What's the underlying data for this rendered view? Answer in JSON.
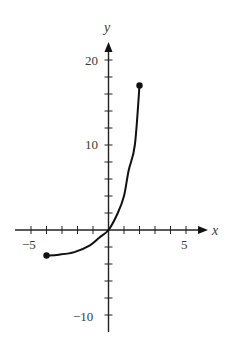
{
  "chart_data": {
    "type": "line",
    "title": "",
    "xlabel": "x",
    "ylabel": "y",
    "xlim": [
      -6.1,
      6.5
    ],
    "ylim": [
      -11.7,
      21.9
    ],
    "x_ticks": [
      -5,
      -4,
      -3,
      -2,
      -1,
      1,
      2,
      3,
      4,
      5
    ],
    "x_tick_labels": [
      {
        "value": -5,
        "label": "−5"
      },
      {
        "value": 5,
        "label": "5"
      }
    ],
    "y_ticks": [
      -10,
      -8,
      -6,
      -4,
      -2,
      2,
      4,
      6,
      8,
      10,
      12,
      14,
      16,
      18,
      20
    ],
    "y_tick_labels": [
      {
        "value": 20,
        "label": "20"
      },
      {
        "value": 10,
        "label": "10"
      },
      {
        "value": -10,
        "label": "−10"
      }
    ],
    "grid": false,
    "legend": null,
    "series": [
      {
        "name": "curve",
        "x": [
          -4,
          -3.2,
          -2.2,
          -1.2,
          -0.6,
          0,
          0.6,
          1.0,
          1.3,
          1.7,
          2.0
        ],
        "y": [
          -3.0,
          -2.9,
          -2.6,
          -1.8,
          -0.9,
          0,
          2,
          4,
          7,
          10,
          17
        ],
        "endpoints": [
          {
            "x": -4,
            "y": -3.0,
            "filled": true
          },
          {
            "x": 2,
            "y": 17,
            "filled": true
          }
        ]
      }
    ]
  },
  "labels": {
    "x_axis": "x",
    "y_axis": "y",
    "x_neg5": "−5",
    "x_pos5": "5",
    "y_20": "20",
    "y_10": "10",
    "y_neg10": "−10"
  }
}
